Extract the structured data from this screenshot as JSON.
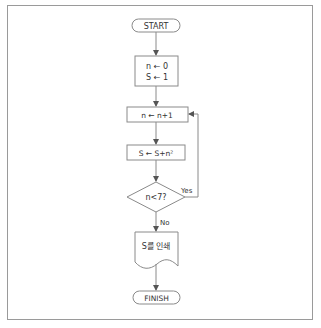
{
  "flowchart": {
    "start": "START",
    "init_line1": "n ← 0",
    "init_line2": "S ← 1",
    "increment": "n ← n+1",
    "accumulate": "S ← S+n²",
    "condition": "n<7?",
    "yes_label": "Yes",
    "no_label": "No",
    "output": "S를 인쇄",
    "finish": "FINISH"
  },
  "colors": {
    "stroke": "#8a8a8a",
    "text": "#333333",
    "frame": "#9a9a9a"
  }
}
